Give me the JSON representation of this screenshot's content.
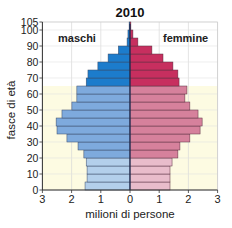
{
  "chart_data": {
    "type": "bar",
    "subtype": "population-pyramid",
    "title": "2010",
    "xlabel": "milioni di persone",
    "ylabel": "fasce di età",
    "xlim": [
      -3,
      3
    ],
    "ylim": [
      0,
      105
    ],
    "xticks": [
      "3",
      "2",
      "1",
      "0",
      "1",
      "2",
      "3"
    ],
    "yticks": [
      0,
      10,
      20,
      30,
      40,
      50,
      60,
      70,
      80,
      90,
      100,
      105
    ],
    "labels": {
      "left": "maschi",
      "right": "femmine"
    },
    "categories": [
      "0-4",
      "5-9",
      "10-14",
      "15-19",
      "20-24",
      "25-29",
      "30-34",
      "35-39",
      "40-44",
      "45-49",
      "50-54",
      "55-59",
      "60-64",
      "65-69",
      "70-74",
      "75-79",
      "80-84",
      "85-89",
      "90-94",
      "95-99",
      "100+"
    ],
    "series": [
      {
        "name": "maschi",
        "values": [
          1.54,
          1.47,
          1.47,
          1.5,
          1.58,
          1.78,
          2.16,
          2.5,
          2.53,
          2.33,
          1.99,
          1.82,
          1.82,
          1.5,
          1.44,
          1.1,
          0.75,
          0.4,
          0.1,
          0.07,
          0.03
        ]
      },
      {
        "name": "femmine",
        "values": [
          1.37,
          1.37,
          1.37,
          1.44,
          1.64,
          1.71,
          2.05,
          2.4,
          2.47,
          2.33,
          2.05,
          1.88,
          1.95,
          1.68,
          1.64,
          1.47,
          1.13,
          0.75,
          0.27,
          0.1,
          0.03
        ]
      }
    ],
    "age_groups": [
      {
        "range": [
          0,
          20
        ],
        "male_color": "#b3cfeb",
        "female_color": "#e9bccb",
        "bg": "#fdfbe2"
      },
      {
        "range": [
          20,
          65
        ],
        "male_color": "#7eaadd",
        "female_color": "#d6819c",
        "bg": "#fdfbe2"
      },
      {
        "range": [
          65,
          105
        ],
        "male_color": "#1c7ccc",
        "female_color": "#c72f5f",
        "bg": "#ffffff"
      }
    ],
    "grid": true
  }
}
